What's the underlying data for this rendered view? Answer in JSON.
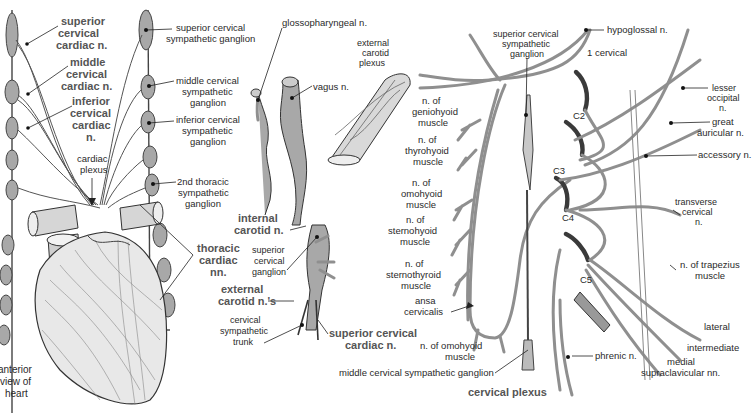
{
  "figures": [
    {
      "id": "heart",
      "caption": [
        "anterior",
        "view of",
        "heart"
      ],
      "labels": {
        "superior_cervical_cardiac": [
          "superior",
          "cervical",
          "cardiac n."
        ],
        "middle_cervical_cardiac": [
          "middle",
          "cervical",
          "cardiac n."
        ],
        "inferior_cervical_cardiac": [
          "inferior",
          "cervical",
          "cardiac",
          "n."
        ],
        "cardiac_plexus": [
          "cardiac",
          "plexus"
        ],
        "superior_cervical_sympathetic_ganglion": [
          "superior cervical",
          "sympathetic ganglion"
        ],
        "middle_cervical_sympathetic_ganglion": [
          "middle cervical",
          "sympathetic",
          "ganglion"
        ],
        "inferior_cervical_sympathetic_ganglion": [
          "inferior cervical",
          "sympathetic",
          "ganglion"
        ],
        "second_thoracic_sympathetic_ganglion": [
          "2nd thoracic",
          "sympathetic",
          "ganglion"
        ],
        "thoracic_cardiac": [
          "thoracic",
          "cardiac",
          "nn."
        ]
      }
    },
    {
      "id": "carotid",
      "labels": {
        "glossopharyngeal": "glossopharyngeal n.",
        "external_carotid_plexus": [
          "external",
          "carotid",
          "plexus"
        ],
        "vagus": "vagus n.",
        "internal_carotid": [
          "internal",
          "carotid n."
        ],
        "superior_cervical_ganglion": [
          "superior",
          "cervical",
          "ganglion"
        ],
        "external_carotid_nn": [
          "external",
          "carotid n.'s"
        ],
        "cervical_sympathetic_trunk": [
          "cervical",
          "sympathetic",
          "trunk"
        ],
        "superior_cervical_cardiac": [
          "superior cervical",
          "cardiac n."
        ]
      }
    },
    {
      "id": "cervical-plexus",
      "caption": "cervical plexus",
      "labels": {
        "superior_cervical_sympathetic_ganglion": [
          "superior cervical",
          "sympathetic",
          "ganglion"
        ],
        "hypoglossal": "hypoglossal n.",
        "first_cervical": "1 cervical",
        "c2": "C2",
        "c3": "C3",
        "c4": "C4",
        "c5": "C5",
        "lesser_occipital": [
          "lesser",
          "occipital",
          "n."
        ],
        "great_auricular": [
          "great",
          "auricular n."
        ],
        "accessory": "accessory n.",
        "transverse_cervical": [
          "transverse",
          "cervical",
          "n."
        ],
        "trapezius": [
          "n. of trapezius",
          "muscle"
        ],
        "lateral": "lateral",
        "intermediate": "intermediate",
        "medial_supraclavicular": [
          "medial",
          "supraclavicular nn."
        ],
        "phrenic": "phrenic n.",
        "middle_cervical_sympathetic_ganglion": "middle cervical sympathetic ganglion",
        "omohyoid_inferior": [
          "n. of omohyoid",
          "muscle"
        ],
        "ansa_cervicalis": [
          "ansa",
          "cervicalis"
        ],
        "geniohyoid": [
          "n. of",
          "geniohyoid",
          "muscle"
        ],
        "thyrohyoid": [
          "n. of",
          "thyrohyoid",
          "muscle"
        ],
        "omohyoid": [
          "n. of",
          "omohyoid",
          "muscle"
        ],
        "sternohyoid": [
          "n. of",
          "sternohyoid",
          "muscle"
        ],
        "sternothyroid": [
          "n. of",
          "sternothyroid",
          "muscle"
        ]
      }
    }
  ],
  "colors": {
    "nerve_fill": "#a8a8a8",
    "outline": "#3a3a3a",
    "bold_label": "#555555",
    "text": "#2a2a2a"
  }
}
